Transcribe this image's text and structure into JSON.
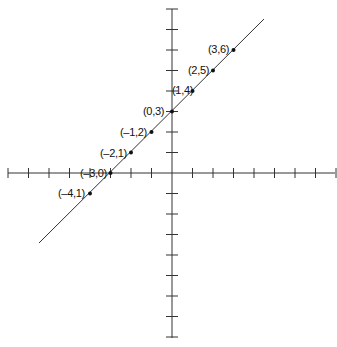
{
  "chart_data": {
    "type": "line",
    "title": "",
    "equation": "y = x + 3",
    "xlabel": "",
    "ylabel": "",
    "xlim": [
      -8,
      8
    ],
    "ylim": [
      -8,
      8
    ],
    "grid": false,
    "series": [
      {
        "name": "line",
        "points": [
          {
            "x": -4,
            "y": -1,
            "label": "(–4,1)"
          },
          {
            "x": -3,
            "y": 0,
            "label": "(–3,0)"
          },
          {
            "x": -2,
            "y": 1,
            "label": "(–2,1)"
          },
          {
            "x": -1,
            "y": 2,
            "label": "(–1,2)"
          },
          {
            "x": 0,
            "y": 3,
            "label": "(0,3)"
          },
          {
            "x": 1,
            "y": 4,
            "label": "(1,4)"
          },
          {
            "x": 2,
            "y": 5,
            "label": "(2,5)"
          },
          {
            "x": 3,
            "y": 6,
            "label": "(3,6)"
          }
        ]
      }
    ]
  },
  "labels": {
    "p0": "(–4,1)",
    "p1": "(–3,0)",
    "p2": "(–2,1)",
    "p3": "(–1,2)",
    "p4": "(0,3)",
    "p5": "(1,4)",
    "p6": "(2,5)",
    "p7": "(3,6)"
  }
}
